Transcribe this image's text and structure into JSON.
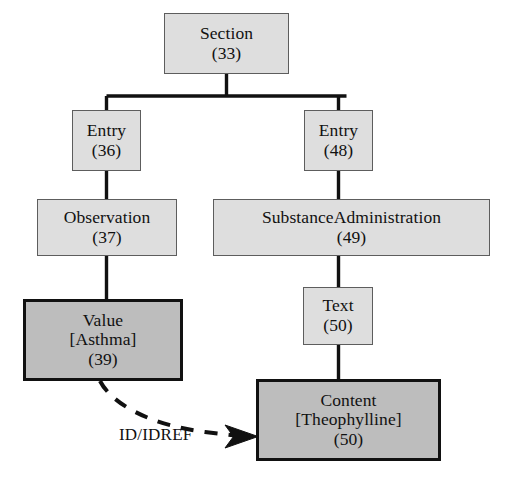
{
  "diagram": {
    "type": "tree",
    "background_color": "#ffffff",
    "light_fill_color": "#dedede",
    "dark_fill_color": "#bdbdbd",
    "border_color": "#5d5d5d",
    "emphasis_border_color": "#111111",
    "text_color": "#111111",
    "nodes": [
      {
        "id": "section",
        "label": "Section",
        "number": "(33)",
        "style": "light",
        "x": 164,
        "y": 13,
        "width": 125,
        "height": 61
      },
      {
        "id": "entry_left",
        "label": "Entry",
        "number": "(36)",
        "style": "light",
        "x": 72,
        "y": 110,
        "width": 69,
        "height": 61
      },
      {
        "id": "entry_right",
        "label": "Entry",
        "number": "(48)",
        "style": "light",
        "x": 304,
        "y": 110,
        "width": 69,
        "height": 61
      },
      {
        "id": "observation",
        "label": "Observation",
        "number": "(37)",
        "style": "light",
        "x": 37,
        "y": 199,
        "width": 140,
        "height": 57
      },
      {
        "id": "substance_administration",
        "label": "SubstanceAdministration",
        "number": "(49)",
        "style": "light",
        "x": 213,
        "y": 199,
        "width": 277,
        "height": 57
      },
      {
        "id": "value_asthma",
        "label": "Value",
        "bracket": "[Asthma]",
        "number": "(39)",
        "style": "dark",
        "x": 23,
        "y": 299,
        "width": 160,
        "height": 82
      },
      {
        "id": "text",
        "label": "Text",
        "number": "(50)",
        "style": "light",
        "x": 303,
        "y": 287,
        "width": 70,
        "height": 58
      },
      {
        "id": "content_theophylline",
        "label": "Content",
        "bracket": "[Theophylline]",
        "number": "(50)",
        "style": "dark",
        "x": 256,
        "y": 379,
        "width": 185,
        "height": 82
      }
    ],
    "edges": [
      {
        "id": "section-to-entry-left",
        "from": "section",
        "to": "entry_left",
        "style": "solid",
        "routing": "orthogonal"
      },
      {
        "id": "section-to-entry-right",
        "from": "section",
        "to": "entry_right",
        "style": "solid",
        "routing": "orthogonal"
      },
      {
        "id": "entry-left-to-observation",
        "from": "entry_left",
        "to": "observation",
        "style": "solid",
        "routing": "straight"
      },
      {
        "id": "entry-right-to-substanceadmin",
        "from": "entry_right",
        "to": "substance_administration",
        "style": "solid",
        "routing": "straight"
      },
      {
        "id": "observation-to-value",
        "from": "observation",
        "to": "value_asthma",
        "style": "solid",
        "routing": "straight"
      },
      {
        "id": "substanceadmin-to-text",
        "from": "substance_administration",
        "to": "text",
        "style": "solid",
        "routing": "straight"
      },
      {
        "id": "text-to-content",
        "from": "text",
        "to": "content_theophylline",
        "style": "solid",
        "routing": "straight"
      },
      {
        "id": "value-to-content-reference",
        "from": "value_asthma",
        "to": "content_theophylline",
        "style": "dashed",
        "routing": "curved",
        "arrowhead": true,
        "label": "ID/IDREF"
      }
    ],
    "edge_labels": {
      "id_idref": "ID/IDREF"
    }
  }
}
